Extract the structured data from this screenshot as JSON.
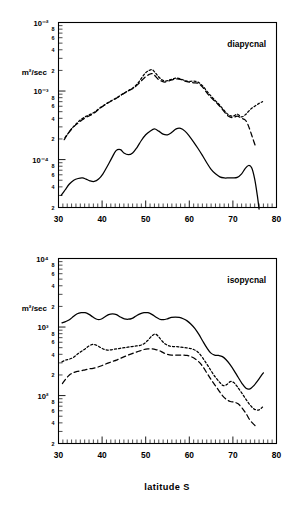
{
  "figure": {
    "x_axis_title": "latitude S",
    "y_unit_label": "m²/sec",
    "x_min": 30,
    "x_max": 80,
    "x_ticks": [
      30,
      40,
      50,
      60,
      70,
      80
    ],
    "x_tick_labels": [
      "30",
      "40",
      "50",
      "60",
      "70",
      "80"
    ],
    "minor_mantissa_labels": [
      "8",
      "6",
      "4",
      "2"
    ]
  },
  "chart_data": [
    {
      "type": "line",
      "title": "diapycnal",
      "panel": "top",
      "xlabel": "latitude S",
      "ylabel": "m²/sec",
      "xlim": [
        30,
        80
      ],
      "ylim": [
        2e-05,
        0.01
      ],
      "yscale": "log",
      "grid": false,
      "legend": "none",
      "y_decade_ticks": [
        0.01,
        0.001,
        0.0001
      ],
      "y_decade_labels": [
        "10⁻²",
        "10⁻³",
        "10⁻⁴"
      ],
      "annotation": "diapycnal",
      "series": [
        {
          "name": "solid",
          "style": "solid",
          "x": [
            30.6,
            31.5,
            32.5,
            33.5,
            34.5,
            35.5,
            36.3,
            37.2,
            38.2,
            39.2,
            40.2,
            41.2,
            42.2,
            43.2,
            44.2,
            45.0,
            46.0,
            47.0,
            48.0,
            49.0,
            50.0,
            51.0,
            52.0,
            53.0,
            54.0,
            55.0,
            56.0,
            57.0,
            58.0,
            59.0,
            60.0,
            61.0,
            62.0,
            63.0,
            64.0,
            65.0,
            66.0,
            67.0,
            68.0,
            69.0,
            70.0,
            71.0,
            72.0,
            72.8,
            73.6,
            74.3,
            75.0,
            75.6,
            76.0
          ],
          "y": [
            3e-05,
            3.6e-05,
            4.4e-05,
            5e-05,
            5.3e-05,
            5.4e-05,
            5.2e-05,
            4.9e-05,
            4.8e-05,
            5.2e-05,
            6.2e-05,
            8e-05,
            0.000105,
            0.000135,
            0.00014,
            0.000125,
            0.000118,
            0.000125,
            0.00015,
            0.00019,
            0.00023,
            0.00026,
            0.00028,
            0.00026,
            0.000235,
            0.00023,
            0.00025,
            0.00028,
            0.000285,
            0.00026,
            0.00022,
            0.00018,
            0.000145,
            0.000115,
            9e-05,
            7.2e-05,
            6.2e-05,
            5.6e-05,
            5.4e-05,
            5.4e-05,
            5.4e-05,
            5.5e-05,
            6.2e-05,
            7.4e-05,
            8.2e-05,
            7.6e-05,
            5.2e-05,
            3e-05,
            1.9e-05
          ]
        },
        {
          "name": "dashed",
          "style": "dashed",
          "x": [
            31.3,
            32.2,
            33.2,
            34.2,
            35.2,
            36.2,
            37.2,
            38.2,
            39.2,
            40.2,
            41.2,
            42.2,
            43.2,
            44.2,
            45.2,
            46.2,
            47.2,
            48.2,
            49.2,
            50.0,
            50.8,
            51.4,
            52.0,
            52.8,
            53.6,
            54.4,
            55.2,
            56.0,
            57.0,
            58.0,
            59.0,
            60.0,
            61.0,
            62.0,
            63.0,
            64.0,
            65.0,
            66.0,
            67.0,
            68.0,
            69.0,
            70.0,
            71.0,
            72.0,
            72.8,
            73.4,
            74.0,
            74.6,
            75.2
          ],
          "y": [
            0.000195,
            0.00024,
            0.00029,
            0.00033,
            0.00037,
            0.00041,
            0.00044,
            0.00048,
            0.00054,
            0.0006,
            0.00066,
            0.00072,
            0.00078,
            0.00086,
            0.00094,
            0.00102,
            0.0011,
            0.00125,
            0.00145,
            0.00162,
            0.00175,
            0.0018,
            0.0017,
            0.0015,
            0.0014,
            0.00135,
            0.0014,
            0.00145,
            0.0015,
            0.00148,
            0.0014,
            0.00135,
            0.00132,
            0.0013,
            0.00115,
            0.00095,
            0.0008,
            0.0007,
            0.0006,
            0.0005,
            0.00043,
            0.00041,
            0.00043,
            0.0004,
            0.00038,
            0.00033,
            0.00026,
            0.0002,
            0.000155
          ]
        },
        {
          "name": "dotted",
          "style": "dotted",
          "x": [
            31.5,
            32.4,
            33.4,
            34.4,
            35.4,
            36.4,
            37.4,
            38.4,
            39.4,
            40.4,
            41.4,
            42.4,
            43.4,
            44.4,
            45.4,
            46.4,
            47.4,
            48.4,
            49.2,
            50.0,
            50.8,
            51.5,
            52.2,
            53.0,
            53.8,
            54.6,
            55.4,
            56.2,
            57.0,
            58.0,
            59.0,
            60.0,
            61.0,
            62.0,
            63.0,
            64.0,
            65.0,
            66.0,
            67.0,
            68.0,
            69.0,
            70.0,
            71.0,
            72.0,
            73.0,
            74.0,
            75.0,
            76.0,
            76.8
          ],
          "y": [
            0.00021,
            0.00025,
            0.0003,
            0.00035,
            0.000395,
            0.00043,
            0.00046,
            0.0005,
            0.00056,
            0.00062,
            0.00068,
            0.00074,
            0.0008,
            0.00088,
            0.00096,
            0.00105,
            0.00115,
            0.00135,
            0.0016,
            0.00185,
            0.002,
            0.00205,
            0.00185,
            0.0016,
            0.00145,
            0.0014,
            0.00145,
            0.0015,
            0.00155,
            0.0015,
            0.00142,
            0.00138,
            0.0014,
            0.00135,
            0.0012,
            0.001,
            0.00084,
            0.00072,
            0.00062,
            0.00052,
            0.00045,
            0.00043,
            0.00046,
            0.00042,
            0.00046,
            0.00054,
            0.0006,
            0.00066,
            0.0007
          ]
        }
      ]
    },
    {
      "type": "line",
      "title": "isopycnal",
      "panel": "bottom",
      "xlabel": "latitude S",
      "ylabel": "m²/sec",
      "xlim": [
        30,
        80
      ],
      "ylim": [
        20,
        10000
      ],
      "yscale": "log",
      "grid": false,
      "legend": "none",
      "y_decade_ticks": [
        10000,
        1000,
        100
      ],
      "y_decade_labels": [
        "10⁴",
        "10³",
        "10²"
      ],
      "annotation": "isopycnal",
      "series": [
        {
          "name": "solid",
          "style": "solid",
          "x": [
            30.8,
            31.6,
            32.5,
            33.4,
            34.3,
            35.2,
            36.1,
            37.0,
            37.9,
            38.8,
            39.7,
            40.6,
            41.5,
            42.4,
            43.3,
            44.2,
            45.1,
            46.0,
            46.9,
            47.8,
            48.7,
            49.6,
            50.5,
            51.4,
            52.3,
            53.2,
            54.1,
            55.0,
            55.9,
            56.8,
            57.7,
            58.6,
            59.5,
            60.4,
            61.3,
            62.2,
            63.1,
            64.0,
            64.9,
            65.8,
            66.7,
            67.6,
            68.5,
            69.4,
            70.3,
            71.2,
            72.1,
            73.0,
            73.9,
            74.8,
            75.7,
            76.5,
            77.0
          ],
          "y": [
            1150,
            1200,
            1280,
            1420,
            1560,
            1620,
            1620,
            1530,
            1400,
            1300,
            1300,
            1400,
            1520,
            1560,
            1520,
            1400,
            1320,
            1300,
            1340,
            1450,
            1560,
            1620,
            1620,
            1530,
            1400,
            1300,
            1280,
            1320,
            1380,
            1400,
            1380,
            1320,
            1230,
            1100,
            950,
            780,
            620,
            500,
            420,
            390,
            385,
            370,
            330,
            280,
            230,
            185,
            150,
            128,
            125,
            140,
            165,
            195,
            215
          ]
        },
        {
          "name": "dotted",
          "style": "dotted",
          "x": [
            30.8,
            31.6,
            32.5,
            33.4,
            34.3,
            35.2,
            36.1,
            37.0,
            37.9,
            38.8,
            39.7,
            40.6,
            41.5,
            42.4,
            43.3,
            44.2,
            45.1,
            46.0,
            46.9,
            47.8,
            48.7,
            49.6,
            50.5,
            51.4,
            52.2,
            53.0,
            53.8,
            54.6,
            55.4,
            56.2,
            57.0,
            58.0,
            59.0,
            60.0,
            61.0,
            62.0,
            63.0,
            64.0,
            65.0,
            66.0,
            67.0,
            67.8,
            68.6,
            69.4,
            70.2,
            71.0,
            72.0,
            73.0,
            74.0,
            75.0,
            76.0,
            76.8
          ],
          "y": [
            310,
            330,
            340,
            360,
            400,
            440,
            480,
            530,
            560,
            540,
            500,
            470,
            460,
            470,
            480,
            490,
            500,
            510,
            520,
            530,
            540,
            570,
            640,
            740,
            790,
            720,
            620,
            560,
            530,
            520,
            520,
            510,
            500,
            490,
            470,
            430,
            360,
            290,
            230,
            185,
            155,
            140,
            145,
            160,
            155,
            135,
            110,
            88,
            72,
            63,
            62,
            68
          ]
        },
        {
          "name": "dashed",
          "style": "dashed",
          "x": [
            30.9,
            31.7,
            32.5,
            33.4,
            34.3,
            35.2,
            36.1,
            37.0,
            37.9,
            38.8,
            39.7,
            40.6,
            41.5,
            42.4,
            43.3,
            44.2,
            45.1,
            46.0,
            46.9,
            47.8,
            48.7,
            49.6,
            50.5,
            51.4,
            52.3,
            53.2,
            54.1,
            55.0,
            55.9,
            56.8,
            57.7,
            58.6,
            59.5,
            60.4,
            61.3,
            62.2,
            63.1,
            64.0,
            64.9,
            65.8,
            66.7,
            67.6,
            68.5,
            69.4,
            70.3,
            71.2,
            72.1,
            73.0,
            73.9,
            74.8,
            75.4
          ],
          "y": [
            150,
            175,
            200,
            215,
            225,
            230,
            238,
            245,
            250,
            258,
            270,
            285,
            300,
            315,
            330,
            350,
            370,
            390,
            410,
            430,
            450,
            470,
            480,
            480,
            470,
            450,
            420,
            400,
            390,
            390,
            390,
            390,
            385,
            370,
            345,
            310,
            265,
            215,
            175,
            145,
            120,
            100,
            88,
            82,
            80,
            76,
            66,
            55,
            44,
            38,
            35
          ]
        }
      ]
    }
  ]
}
